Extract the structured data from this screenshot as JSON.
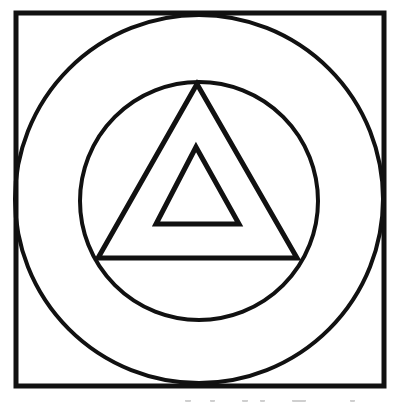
{
  "diagram": {
    "stroke_color": "#111111",
    "background_color": "#ffffff",
    "square": {
      "x": 16,
      "y": 13,
      "width": 368,
      "height": 373,
      "stroke_width": 5
    },
    "outer_circle": {
      "cx": 199,
      "cy": 199,
      "r": 184,
      "stroke_width": 4
    },
    "inner_circle": {
      "cx": 199,
      "cy": 201,
      "r": 119,
      "stroke_width": 4
    },
    "outer_triangle": {
      "points": "197,84 98,258 297,258",
      "stroke_width": 5
    },
    "inner_triangle": {
      "points": "196,147 156,224 239,224",
      "stroke_width": 5
    }
  }
}
